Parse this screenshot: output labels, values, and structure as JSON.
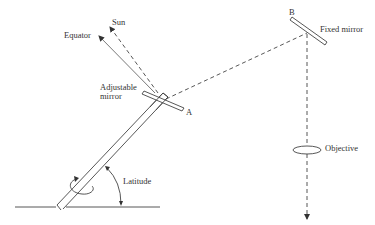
{
  "diagram": {
    "type": "coelostat-heliostat schematic",
    "labels": {
      "sun": "Sun",
      "equator": "Equator",
      "adjustable_mirror_line1": "Adjustable",
      "adjustable_mirror_line2": "mirror",
      "point_a": "A",
      "point_b": "B",
      "fixed_mirror": "Fixed mirror",
      "objective": "Objective",
      "latitude": "Latitude"
    },
    "colors": {
      "stroke": "#444444",
      "text": "#333333",
      "background": "#ffffff"
    }
  }
}
